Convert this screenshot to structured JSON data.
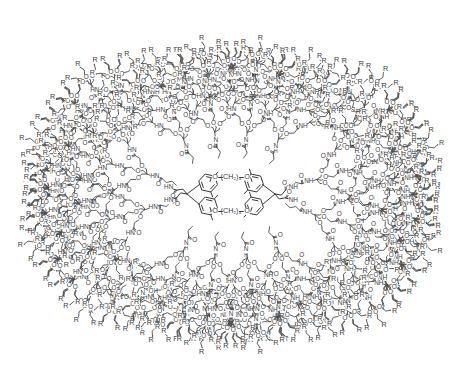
{
  "figure": {
    "kind": "chemical-structure-diagram",
    "background_color": "#ffffff",
    "line_color": "#4d4d4d",
    "text_color": "#3c3c3c",
    "canvas": {
      "width": 462,
      "height": 388
    }
  },
  "labels": {
    "terminal_group": "R",
    "oxygen": "O",
    "nitrogen": "N",
    "hydrogen": "H",
    "amide_nh": "NH",
    "amide_hn": "HN",
    "carbonyl_oxygen": "O",
    "core_linker_prefix": "O",
    "core_linker_chain": "(CH",
    "core_linker_sub": "2",
    "core_linker_chain_end": ")",
    "core_linker_count": "4",
    "core_linker_suffix": "O"
  },
  "core": {
    "linker_text_left": "O",
    "linker_text_mid": "(CH₂)₄",
    "linker_text_right": "O",
    "aryl_methyl_count": 2,
    "rings": 4,
    "center_x": 231,
    "center_y": 194
  },
  "dendrimer": {
    "generations": 4,
    "branch_multiplicity": 3,
    "terminal_count": 96,
    "repeat_unit": "NH-C(CH2CH2O)3",
    "core_arms": 4,
    "radius_x": 222,
    "radius_y": 176
  },
  "geometry": {
    "sectors": [
      {
        "name": "upper-left",
        "angle_start": 160,
        "angle_end": 250
      },
      {
        "name": "upper-right",
        "angle_start": 290,
        "angle_end": 380
      },
      {
        "name": "lower-right",
        "angle_start": 20,
        "angle_end": 110
      },
      {
        "name": "lower-left",
        "angle_start": 70,
        "angle_end": 160
      }
    ]
  }
}
